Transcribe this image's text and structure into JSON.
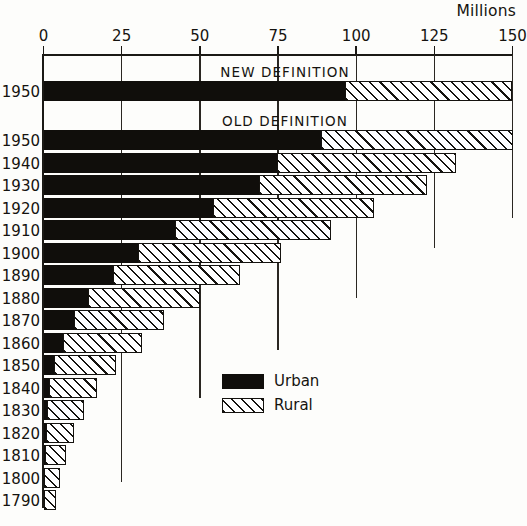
{
  "chart_data": {
    "type": "bar",
    "orientation": "horizontal",
    "stacked": true,
    "title": "",
    "xlabel": "Millions",
    "ylabel": "",
    "xlim": [
      0,
      150
    ],
    "xticks": [
      0,
      25,
      50,
      75,
      100,
      125,
      150
    ],
    "xticklabels": [
      "0",
      "25",
      "50",
      "75",
      "100",
      "125",
      "150"
    ],
    "grid": "vertical-partial",
    "legend_position": "inside-center-right",
    "legend": [
      {
        "label": "Urban",
        "fill": "solid-black",
        "color": "#100e0b"
      },
      {
        "label": "Rural",
        "fill": "diagonal-hatch",
        "color": "#15130f"
      }
    ],
    "group_labels": [
      "NEW DEFINITION",
      "OLD DEFINITION"
    ],
    "series": [
      {
        "name": "Urban",
        "values": [
          96.5,
          88.9,
          74.7,
          69.0,
          54.2,
          42.0,
          30.2,
          22.1,
          14.1,
          9.9,
          6.2,
          3.5,
          1.8,
          1.1,
          0.7,
          0.5,
          0.3,
          0.2
        ]
      },
      {
        "name": "Rural",
        "values": [
          53.5,
          61.2,
          57.2,
          53.8,
          51.6,
          50.0,
          45.8,
          40.8,
          36.0,
          28.7,
          25.2,
          19.6,
          15.2,
          11.7,
          8.9,
          6.7,
          5.0,
          3.7
        ]
      }
    ],
    "categories": [
      "1950",
      "1950",
      "1940",
      "1930",
      "1920",
      "1910",
      "1900",
      "1890",
      "1880",
      "1870",
      "1860",
      "1850",
      "1840",
      "1830",
      "1820",
      "1810",
      "1800",
      "1790"
    ],
    "bars": [
      {
        "year": "1950",
        "group": "NEW DEFINITION",
        "urban": 96.5,
        "rural": 53.5,
        "total": 150.0
      },
      {
        "year": "1950",
        "group": "OLD DEFINITION",
        "urban": 88.9,
        "rural": 61.2,
        "total": 150.1
      },
      {
        "year": "1940",
        "group": "OLD DEFINITION",
        "urban": 74.7,
        "rural": 57.2,
        "total": 131.9
      },
      {
        "year": "1930",
        "group": "OLD DEFINITION",
        "urban": 69.0,
        "rural": 53.8,
        "total": 122.8
      },
      {
        "year": "1920",
        "group": "OLD DEFINITION",
        "urban": 54.2,
        "rural": 51.6,
        "total": 105.8
      },
      {
        "year": "1910",
        "group": "OLD DEFINITION",
        "urban": 42.0,
        "rural": 50.0,
        "total": 92.0
      },
      {
        "year": "1900",
        "group": "OLD DEFINITION",
        "urban": 30.2,
        "rural": 45.8,
        "total": 76.0
      },
      {
        "year": "1890",
        "group": "OLD DEFINITION",
        "urban": 22.1,
        "rural": 40.8,
        "total": 62.9
      },
      {
        "year": "1880",
        "group": "OLD DEFINITION",
        "urban": 14.1,
        "rural": 36.0,
        "total": 50.1
      },
      {
        "year": "1870",
        "group": "OLD DEFINITION",
        "urban": 9.9,
        "rural": 28.7,
        "total": 38.6
      },
      {
        "year": "1860",
        "group": "OLD DEFINITION",
        "urban": 6.2,
        "rural": 25.2,
        "total": 31.4
      },
      {
        "year": "1850",
        "group": "OLD DEFINITION",
        "urban": 3.5,
        "rural": 19.6,
        "total": 23.1
      },
      {
        "year": "1840",
        "group": "OLD DEFINITION",
        "urban": 1.8,
        "rural": 15.2,
        "total": 17.0
      },
      {
        "year": "1830",
        "group": "OLD DEFINITION",
        "urban": 1.1,
        "rural": 11.7,
        "total": 12.8
      },
      {
        "year": "1820",
        "group": "OLD DEFINITION",
        "urban": 0.7,
        "rural": 8.9,
        "total": 9.6
      },
      {
        "year": "1810",
        "group": "OLD DEFINITION",
        "urban": 0.5,
        "rural": 6.7,
        "total": 7.2
      },
      {
        "year": "1800",
        "group": "OLD DEFINITION",
        "urban": 0.3,
        "rural": 5.0,
        "total": 5.3
      },
      {
        "year": "1790",
        "group": "OLD DEFINITION",
        "urban": 0.2,
        "rural": 3.7,
        "total": 3.9
      }
    ],
    "gridline_extents": {
      "25": 482,
      "50": 398,
      "75": 350,
      "100": 298,
      "125": 248,
      "150": 218
    }
  },
  "axis": {
    "units_label": "Millions"
  }
}
